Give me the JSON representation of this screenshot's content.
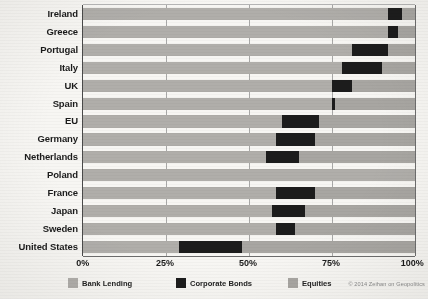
{
  "chart_data": {
    "type": "bar",
    "orientation": "horizontal",
    "stacked": true,
    "title": "",
    "xlabel": "",
    "ylabel": "",
    "xlim": [
      0,
      100
    ],
    "xticks": [
      "0%",
      "25%",
      "50%",
      "75%",
      "100%"
    ],
    "xtick_values": [
      0,
      25,
      50,
      75,
      100
    ],
    "grid": true,
    "grid_axis": "x",
    "legend_position": "bottom",
    "categories": [
      "Ireland",
      "Greece",
      "Portugal",
      "Italy",
      "UK",
      "Spain",
      "EU",
      "Germany",
      "Netherlands",
      "Poland",
      "France",
      "Japan",
      "Sweden",
      "United States"
    ],
    "series": [
      {
        "name": "Bank Lending",
        "color": "#b0aeaa",
        "values": [
          92,
          92,
          81,
          78,
          75,
          75,
          60,
          58,
          55,
          60,
          58,
          57,
          58,
          29
        ]
      },
      {
        "name": "Corporate Bonds",
        "color": "#1c1c1c",
        "values": [
          4,
          3,
          11,
          12,
          6,
          1,
          11,
          12,
          10,
          0,
          12,
          10,
          6,
          19
        ]
      },
      {
        "name": "Equities",
        "color": "#a8a6a2",
        "values": [
          4,
          5,
          8,
          10,
          19,
          24,
          29,
          30,
          35,
          40,
          30,
          33,
          36,
          52
        ]
      }
    ],
    "bond_segments": [
      {
        "category": "Ireland",
        "start": 92,
        "end": 96
      },
      {
        "category": "Greece",
        "start": 92,
        "end": 95
      },
      {
        "category": "Portugal",
        "start": 81,
        "end": 92
      },
      {
        "category": "Italy",
        "start": 78,
        "end": 90
      },
      {
        "category": "UK",
        "start": 75,
        "end": 81
      },
      {
        "category": "Spain",
        "start": 75,
        "end": 76
      },
      {
        "category": "EU",
        "start": 60,
        "end": 71
      },
      {
        "category": "Germany",
        "start": 58,
        "end": 70
      },
      {
        "category": "Netherlands",
        "start": 55,
        "end": 65
      },
      {
        "category": "Poland",
        "start": 0,
        "end": 0
      },
      {
        "category": "France",
        "start": 58,
        "end": 70
      },
      {
        "category": "Japan",
        "start": 57,
        "end": 67
      },
      {
        "category": "Sweden",
        "start": 58,
        "end": 64
      },
      {
        "category": "United States",
        "start": 29,
        "end": 48
      }
    ]
  },
  "legend": {
    "items": [
      {
        "label": "Bank Lending",
        "color": "#b0aeaa"
      },
      {
        "label": "Corporate Bonds",
        "color": "#1c1c1c"
      },
      {
        "label": "Equities",
        "color": "#a8a6a2"
      }
    ]
  },
  "credit": "© 2014 Zeihan on Geopolitics"
}
